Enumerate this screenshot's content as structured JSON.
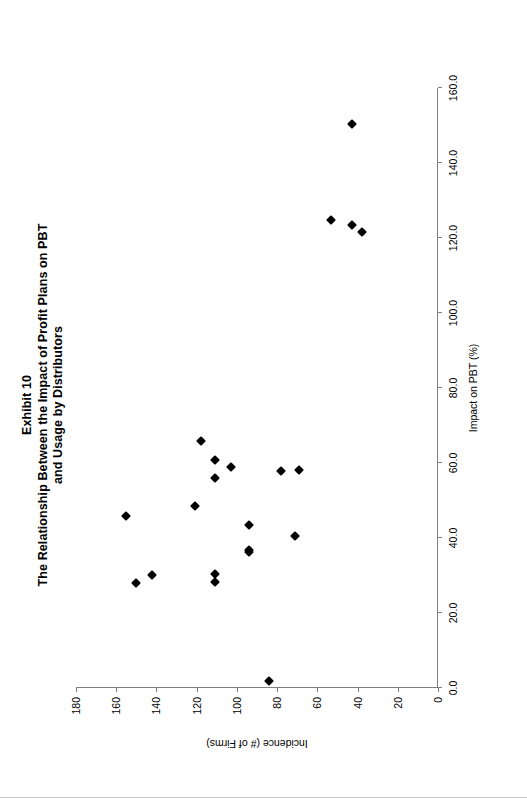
{
  "figure": {
    "title_lines": [
      "Exhibit 10",
      "The Relationship Between the Impact of Profit Plans on PBT",
      "and Usage by Distributors"
    ]
  },
  "chart_data": {
    "type": "scatter",
    "xlabel": "Impact on PBT (%)",
    "ylabel": "Incidence (# of Firms)",
    "xlim": [
      0.0,
      160.0
    ],
    "ylim": [
      0,
      180
    ],
    "xticks": [
      "0.0",
      "20.0",
      "40.0",
      "60.0",
      "80.0",
      "100.0",
      "120.0",
      "140.0",
      "160.0"
    ],
    "yticks": [
      "0",
      "20",
      "40",
      "60",
      "80",
      "100",
      "120",
      "140",
      "160",
      "180"
    ],
    "grid": false,
    "legend": false,
    "marker": "filled-diamond",
    "marker_color": "#000000",
    "axis_color": "#808080",
    "series": [
      {
        "name": "Distributors",
        "points": [
          {
            "x": 150.5,
            "y": 43
          },
          {
            "x": 124.9,
            "y": 53
          },
          {
            "x": 123.5,
            "y": 43
          },
          {
            "x": 121.5,
            "y": 38
          },
          {
            "x": 65.8,
            "y": 118
          },
          {
            "x": 60.9,
            "y": 111
          },
          {
            "x": 58.9,
            "y": 103
          },
          {
            "x": 56.1,
            "y": 111
          },
          {
            "x": 57.9,
            "y": 78
          },
          {
            "x": 58.0,
            "y": 69
          },
          {
            "x": 48.6,
            "y": 121
          },
          {
            "x": 45.8,
            "y": 155
          },
          {
            "x": 43.5,
            "y": 94
          },
          {
            "x": 40.5,
            "y": 71
          },
          {
            "x": 36.7,
            "y": 94
          },
          {
            "x": 36.2,
            "y": 94
          },
          {
            "x": 30.5,
            "y": 111
          },
          {
            "x": 28.2,
            "y": 111
          },
          {
            "x": 30.0,
            "y": 142
          },
          {
            "x": 27.9,
            "y": 150
          },
          {
            "x": 1.8,
            "y": 84
          }
        ]
      }
    ]
  }
}
